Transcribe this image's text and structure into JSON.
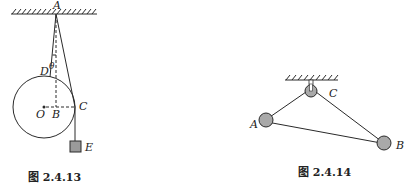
{
  "figures": [
    {
      "caption": "图 2.4.13",
      "labels": {
        "A": "A",
        "D": "D",
        "theta": "θ",
        "O": "O",
        "B": "B",
        "C": "C",
        "E": "E"
      }
    },
    {
      "caption": "图 2.4.14",
      "labels": {
        "A": "A",
        "B": "B",
        "C": "C"
      }
    }
  ],
  "colors": {
    "stroke": "#2a2a2a",
    "ball_fill": "#a9a9a9",
    "block_fill": "#9a9a9a",
    "background": "#ffffff"
  }
}
